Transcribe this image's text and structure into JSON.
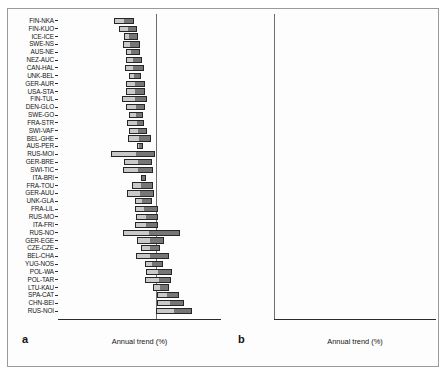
{
  "figure": {
    "background": "#ffffff",
    "frame_color": "#9a9a9a",
    "bar_light_color": "#c9c9c9",
    "bar_dark_color": "#767676",
    "bar_outline_color": "#262626",
    "zero_line_color": "#6e6e6e"
  },
  "panels": [
    {
      "letter": "a",
      "name": "panel-a",
      "xlabel": "Annual trend (%)",
      "xticks": [
        -15,
        -10,
        -5,
        0,
        5,
        10
      ],
      "xtick_labels": [
        "-15",
        "-10",
        "-5",
        "0",
        "5",
        "10"
      ],
      "xlim": [
        -15,
        10
      ]
    },
    {
      "letter": "b",
      "name": "panel-b",
      "xlabel": "Annual trend (%)",
      "xticks": [
        -15,
        -10,
        -5,
        0,
        5,
        10
      ],
      "xtick_labels": [
        "-15",
        "-10",
        "-5",
        "0",
        "5",
        "10"
      ],
      "xlim": [
        -15,
        10
      ]
    }
  ],
  "chart_data": [
    {
      "type": "bar",
      "orientation": "horizontal",
      "panel": "a",
      "title": "",
      "xlabel": "Annual trend (%)",
      "ylabel": "",
      "xlim": [
        -15,
        10
      ],
      "grid": false,
      "legend": "none",
      "zero_reference_line": 0,
      "series": [
        {
          "name": "lower segment",
          "color": "#c9c9c9"
        },
        {
          "name": "upper segment",
          "color": "#767676"
        }
      ],
      "categories": [
        "FIN-NKA",
        "FIN-KUO",
        "ICE-ICE",
        "SWE-NS",
        "AUS-NE",
        "NEZ-AUC",
        "CAN-HAL",
        "UNK-BEL",
        "GER-AUR",
        "USA-STA",
        "FIN-TUL",
        "DEN-GLO",
        "SWE-GO",
        "FRA-STR",
        "SWI-VAF",
        "BEL-GHE",
        "AUS-PER",
        "RUS-MOI",
        "GER-BRE",
        "SWI-TIC",
        "ITA-BRI",
        "FRA-TOU",
        "GER-AUU",
        "UNK-GLA",
        "FRA-LIL",
        "RUS-MO",
        "ITA-FRI",
        "RUS-NO",
        "GER-EGE",
        "CZE-CZE",
        "BEL-CHA",
        "YUG-NOS",
        "POL-WA",
        "POL-TAR",
        "LTU-KAU",
        "SPA-CAT",
        "CHN-BEI",
        "RUS-NOI"
      ],
      "bars": [
        {
          "category": "FIN-NKA",
          "low": -6.4,
          "mid": -4.7,
          "high": -3.3
        },
        {
          "category": "FIN-KUO",
          "low": -5.6,
          "mid": -4.1,
          "high": -2.9
        },
        {
          "category": "ICE-ICE",
          "low": -4.9,
          "mid": -4.0,
          "high": -2.7
        },
        {
          "category": "SWE-NS",
          "low": -5.0,
          "mid": -3.8,
          "high": -2.4
        },
        {
          "category": "AUS-NE",
          "low": -4.6,
          "mid": -3.6,
          "high": -2.4
        },
        {
          "category": "NEZ-AUC",
          "low": -4.6,
          "mid": -3.4,
          "high": -2.1
        },
        {
          "category": "CAN-HAL",
          "low": -4.8,
          "mid": -3.3,
          "high": -1.8
        },
        {
          "category": "UNK-BEL",
          "low": -4.1,
          "mid": -3.2,
          "high": -2.3
        },
        {
          "category": "GER-AUR",
          "low": -4.5,
          "mid": -3.1,
          "high": -1.7
        },
        {
          "category": "USA-STA",
          "low": -4.5,
          "mid": -3.0,
          "high": -1.7
        },
        {
          "category": "FIN-TUL",
          "low": -5.2,
          "mid": -3.0,
          "high": -1.4
        },
        {
          "category": "DEN-GLO",
          "low": -4.6,
          "mid": -2.9,
          "high": -1.6
        },
        {
          "category": "SWE-GO",
          "low": -4.1,
          "mid": -2.9,
          "high": -1.9
        },
        {
          "category": "FRA-STR",
          "low": -4.4,
          "mid": -2.8,
          "high": -1.8
        },
        {
          "category": "SWI-VAF",
          "low": -4.1,
          "mid": -2.6,
          "high": -1.3
        },
        {
          "category": "BEL-GHE",
          "low": -4.2,
          "mid": -2.4,
          "high": -0.7
        },
        {
          "category": "AUS-PER",
          "low": -2.9,
          "mid": -2.4,
          "high": -1.9
        },
        {
          "category": "RUS-MOI",
          "low": -6.9,
          "mid": -2.9,
          "high": -0.1
        },
        {
          "category": "GER-BRE",
          "low": -4.9,
          "mid": -2.6,
          "high": -0.6
        },
        {
          "category": "SWI-TIC",
          "low": -5.0,
          "mid": -2.5,
          "high": -0.4
        },
        {
          "category": "ITA-BRI",
          "low": -2.2,
          "mid": -1.9,
          "high": -1.5
        },
        {
          "category": "FRA-TOU",
          "low": -3.6,
          "mid": -2.1,
          "high": -0.5
        },
        {
          "category": "GER-AUU",
          "low": -4.4,
          "mid": -2.2,
          "high": -0.3
        },
        {
          "category": "UNK-GLA",
          "low": -3.2,
          "mid": -2.0,
          "high": -0.6
        },
        {
          "category": "FRA-LIL",
          "low": -3.2,
          "mid": -1.6,
          "high": 0.3
        },
        {
          "category": "RUS-MO",
          "low": -3.1,
          "mid": -1.4,
          "high": 0.3
        },
        {
          "category": "ITA-FRI",
          "low": -3.2,
          "mid": -1.4,
          "high": 0.4
        },
        {
          "category": "RUS-NO",
          "low": -5.1,
          "mid": -0.9,
          "high": 3.7
        },
        {
          "category": "GER-EGE",
          "low": -2.9,
          "mid": -0.8,
          "high": 1.3
        },
        {
          "category": "CZE-CZE",
          "low": -2.2,
          "mid": -0.8,
          "high": 0.7
        },
        {
          "category": "BEL-CHA",
          "low": -3.0,
          "mid": -0.7,
          "high": 2.1
        },
        {
          "category": "YUG-NOS",
          "low": -1.7,
          "mid": -0.4,
          "high": 1.1
        },
        {
          "category": "POL-WA",
          "low": -1.5,
          "mid": 0.5,
          "high": 2.5
        },
        {
          "category": "POL-TAR",
          "low": -1.7,
          "mid": 0.6,
          "high": 2.4
        },
        {
          "category": "LTU-KAU",
          "low": -0.5,
          "mid": 0.8,
          "high": 2.0
        },
        {
          "category": "SPA-CAT",
          "low": 0.2,
          "mid": 1.9,
          "high": 3.6
        },
        {
          "category": "CHN-BEI",
          "low": 0.2,
          "mid": 2.4,
          "high": 4.3
        },
        {
          "category": "RUS-NOI",
          "low": 0.1,
          "mid": 2.9,
          "high": 5.6
        }
      ]
    },
    {
      "type": "bar",
      "orientation": "horizontal",
      "panel": "b",
      "title": "",
      "xlabel": "Annual trend (%)",
      "ylabel": "",
      "xlim": [
        -15,
        10
      ],
      "grid": false,
      "legend": "none",
      "zero_reference_line": 0,
      "series": [
        {
          "name": "lower segment",
          "color": "#c9c9c9"
        },
        {
          "name": "upper segment",
          "color": "#767676"
        }
      ],
      "categories": [
        "RUS-MOC",
        "FRA-STR",
        "AUS-NEW",
        "FIN-NKA",
        "FIN-TUL",
        "FIN-KUO",
        "ICE-ICE",
        "SWE-GOT",
        "ITA-BRI",
        "NEZ-AUC",
        "BEL-GHE",
        "DEN-GLO",
        "USA-STA",
        "UNK-BEL",
        "SWE-NS",
        "AUS-PER",
        "FRA-TOU",
        "RUS-MOI",
        "FRA-LIL",
        "ITA-FRI",
        "CHN-BEI",
        "GER-AUU",
        "GER-BRE",
        "POL-TAR",
        "UNK-GLA",
        "CAN-HAL",
        "POL-WAR",
        "BEL-CHA",
        "RUS-NOC",
        "RUS-NOI",
        "GER-EGE",
        "SPA-CAT",
        "CZE-CZE",
        "LTU-KAU",
        "YUG-NOS",
        "GER-AUR"
      ],
      "bars": [
        {
          "category": "RUS-MOC",
          "low": -9.2,
          "mid": -6.9,
          "high": -4.8
        },
        {
          "category": "FRA-STR",
          "low": -9.5,
          "mid": -6.9,
          "high": -4.2
        },
        {
          "category": "AUS-NEW",
          "low": -8.0,
          "mid": -6.1,
          "high": -4.1
        },
        {
          "category": "FIN-NKA",
          "low": -7.6,
          "mid": -5.6,
          "high": -3.4
        },
        {
          "category": "FIN-TUL",
          "low": -7.4,
          "mid": -5.2,
          "high": -3.1
        },
        {
          "category": "FIN-KUO",
          "low": -6.6,
          "mid": -5.0,
          "high": -3.3
        },
        {
          "category": "ICE-ICE",
          "low": -7.0,
          "mid": -4.9,
          "high": -2.6
        },
        {
          "category": "SWE-GOT",
          "low": -6.0,
          "mid": -4.7,
          "high": -3.1
        },
        {
          "category": "ITA-BRI",
          "low": -6.0,
          "mid": -4.5,
          "high": -3.0
        },
        {
          "category": "NEZ-AUC",
          "low": -6.1,
          "mid": -4.4,
          "high": -2.8
        },
        {
          "category": "BEL-GHE",
          "low": -7.0,
          "mid": -3.8,
          "high": -0.6
        },
        {
          "category": "DEN-GLO",
          "low": -5.9,
          "mid": -4.0,
          "high": -0.8
        },
        {
          "category": "USA-STA",
          "low": -5.2,
          "mid": -3.8,
          "high": -2.0
        },
        {
          "category": "UNK-BEL",
          "low": -4.3,
          "mid": -3.5,
          "high": -2.6
        },
        {
          "category": "SWE-NS",
          "low": -4.9,
          "mid": -3.5,
          "high": -2.1
        },
        {
          "category": "AUS-PER",
          "low": -5.3,
          "mid": -3.6,
          "high": -1.9
        },
        {
          "category": "FRA-TOU",
          "low": -5.3,
          "mid": -3.0,
          "high": -0.6
        },
        {
          "category": "RUS-MOI",
          "low": -8.2,
          "mid": -3.2,
          "high": 1.2
        },
        {
          "category": "FRA-LIL",
          "low": -4.2,
          "mid": -2.1,
          "high": 0.4
        },
        {
          "category": "ITA-FRI",
          "low": -4.1,
          "mid": -1.4,
          "high": 1.5
        },
        {
          "category": "CHN-BEI",
          "low": -3.7,
          "mid": -1.6,
          "high": 1.6
        },
        {
          "category": "GER-AUU",
          "low": -5.4,
          "mid": -1.2,
          "high": 3.4
        },
        {
          "category": "GER-BRE",
          "low": -4.2,
          "mid": -0.8,
          "high": 2.3
        },
        {
          "category": "POL-TAR",
          "low": -3.0,
          "mid": -0.7,
          "high": 1.6
        },
        {
          "category": "UNK-GLA",
          "low": -2.1,
          "mid": -0.5,
          "high": 1.3
        },
        {
          "category": "CAN-HAL",
          "low": -1.9,
          "mid": -0.5,
          "high": 0.9
        },
        {
          "category": "POL-WAR",
          "low": -0.3,
          "mid": 0.5,
          "high": 1.4
        },
        {
          "category": "BEL-CHA",
          "low": -2.3,
          "mid": 0.3,
          "high": 2.9
        },
        {
          "category": "RUS-NOC",
          "low": -3.8,
          "mid": 0.9,
          "high": 4.9
        },
        {
          "category": "RUS-NOI",
          "low": -2.9,
          "mid": 1.0,
          "high": 4.4
        },
        {
          "category": "GER-EGE",
          "low": -0.4,
          "mid": 1.3,
          "high": 2.5
        },
        {
          "category": "SPA-CAT",
          "low": -0.1,
          "mid": 2.1,
          "high": 3.9
        },
        {
          "category": "CZE-CZE",
          "low": -1.6,
          "mid": 1.9,
          "high": 4.7
        },
        {
          "category": "LTU-KAU",
          "low": -1.0,
          "mid": 2.5,
          "high": 6.1
        },
        {
          "category": "YUG-NOS",
          "low": 0.1,
          "mid": 2.1,
          "high": 4.6
        },
        {
          "category": "GER-AUR",
          "low": 0.3,
          "mid": 3.1,
          "high": 6.2
        }
      ]
    }
  ]
}
